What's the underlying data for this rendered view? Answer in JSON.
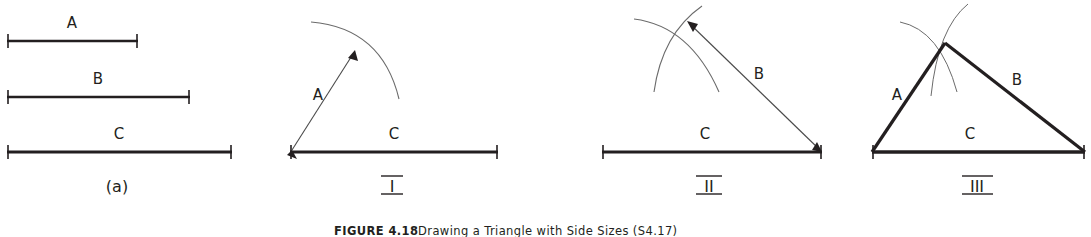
{
  "figure": {
    "caption_label": "FIGURE 4.18",
    "caption_text": "Drawing a Triangle with Side Sizes (S4.17)",
    "panels": [
      {
        "id": "panel-a",
        "label": "(a)",
        "description": "three given side lengths shown as measured segments",
        "segments": [
          {
            "name": "A",
            "label": "A",
            "x1": 7,
            "x2": 138,
            "y": 41,
            "label_x": 72,
            "label_y": 28
          },
          {
            "name": "B",
            "label": "B",
            "x1": 7,
            "x2": 190,
            "y": 97,
            "label_x": 98,
            "label_y": 84
          },
          {
            "name": "C",
            "label": "C",
            "x1": 7,
            "x2": 232,
            "y": 152,
            "label_x": 119,
            "label_y": 139
          }
        ]
      },
      {
        "id": "panel-i",
        "label": "I",
        "description": "baseline C drawn; arc of radius A swung from left endpoint",
        "baseline": {
          "label": "C",
          "x1": 290,
          "x2": 498,
          "y": 152,
          "label_x": 394,
          "label_y": 139
        },
        "arrow": {
          "label": "A",
          "label_x": 320,
          "label_y": 97,
          "from_x": 290,
          "from_y": 152,
          "to_x": 355,
          "to_y": 51
        }
      },
      {
        "id": "panel-ii",
        "label": "II",
        "description": "second arc of radius B swung from right endpoint, crossing the first arc",
        "baseline": {
          "label": "C",
          "x1": 602,
          "x2": 822,
          "y": 152,
          "label_x": 705,
          "label_y": 139
        },
        "arrow": {
          "label": "B",
          "label_x": 760,
          "label_y": 78,
          "from_x": 822,
          "from_y": 152,
          "to_x": 690,
          "to_y": 22
        }
      },
      {
        "id": "panel-iii",
        "label": "III",
        "description": "triangle completed by joining the arc intersection to both ends of C",
        "baseline": {
          "label": "C",
          "x1": 872,
          "x2": 1085,
          "y": 152,
          "label_x": 970,
          "label_y": 139
        },
        "apex": {
          "x": 945,
          "y": 43
        },
        "side_a": {
          "label": "A",
          "label_x": 897,
          "label_y": 99
        },
        "side_b": {
          "label": "B",
          "label_x": 1017,
          "label_y": 84
        }
      }
    ],
    "colors": {
      "ink": "#231f20",
      "thin_line": "#5a5a5a",
      "background": "#ffffff"
    }
  }
}
